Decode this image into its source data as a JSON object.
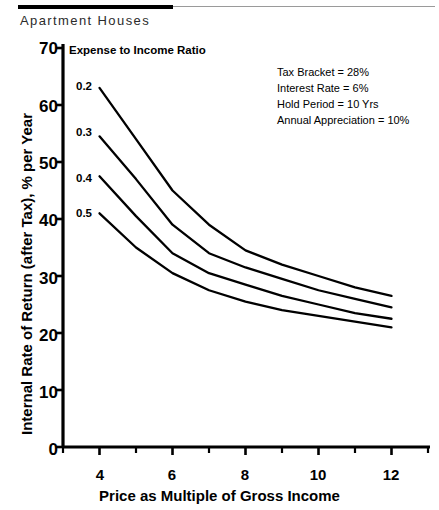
{
  "figure": {
    "caption": "Apartment Houses"
  },
  "annotations": {
    "legend_title": "Expense to Income Ratio",
    "parameters": [
      "Tax Bracket = 28%",
      "Interest Rate = 6%",
      "Hold Period = 10 Yrs",
      "Annual Appreciation = 10%"
    ]
  },
  "chart_data": {
    "type": "line",
    "title": "Apartment Houses",
    "xlabel": "Price as Multiple of Gross Income",
    "ylabel": "Internal Rate of Return (after Tax), % per Year",
    "xlim": [
      3,
      13
    ],
    "ylim": [
      0,
      70
    ],
    "xticks": [
      4,
      6,
      8,
      10,
      12
    ],
    "xtick_labels": [
      "4",
      "6",
      "8",
      "10",
      "12"
    ],
    "xminor_ticks": [
      3,
      5,
      7,
      9,
      11,
      13
    ],
    "yticks": [
      0,
      10,
      20,
      30,
      40,
      50,
      60,
      70
    ],
    "ytick_labels": [
      "0",
      "10",
      "20",
      "30",
      "40",
      "50",
      "60",
      "70"
    ],
    "grid": false,
    "legend_position": "inline-curve-labels",
    "legend_title": "Expense to Income Ratio",
    "x": [
      4,
      5,
      6,
      7,
      8,
      9,
      10,
      11,
      12
    ],
    "series": [
      {
        "name": "0.2",
        "label": "0.2",
        "values": [
          63,
          54,
          45,
          39,
          34.5,
          32,
          30,
          28,
          26.5
        ]
      },
      {
        "name": "0.3",
        "label": "0.3",
        "values": [
          54.5,
          47,
          39,
          34,
          31.5,
          29.5,
          27.5,
          26,
          24.5
        ]
      },
      {
        "name": "0.4",
        "label": "0.4",
        "values": [
          47.5,
          40.5,
          34,
          30.5,
          28.5,
          26.5,
          25,
          23.5,
          22.5
        ]
      },
      {
        "name": "0.5",
        "label": "0.5",
        "values": [
          41,
          35,
          30.5,
          27.5,
          25.5,
          24,
          23,
          22,
          21
        ]
      }
    ],
    "annotations": [
      "Tax Bracket = 28%",
      "Interest Rate = 6%",
      "Hold Period = 10 Yrs",
      "Annual Appreciation = 10%"
    ]
  },
  "axes": {
    "x_title": "Price as Multiple of Gross Income",
    "y_title": "Internal Rate of Return (after Tax), % per Year",
    "x_tick_labels": [
      "4",
      "6",
      "8",
      "10",
      "12"
    ],
    "y_tick_labels": [
      "70",
      "60",
      "50",
      "40",
      "30",
      "20",
      "10",
      "0"
    ]
  },
  "curve_labels": [
    "0.2",
    "0.3",
    "0.4",
    "0.5"
  ]
}
